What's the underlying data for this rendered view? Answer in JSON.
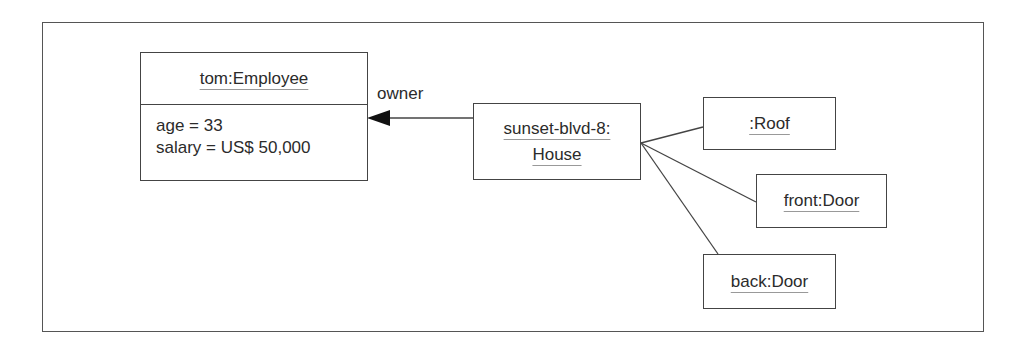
{
  "diagram": {
    "type": "UML object diagram",
    "objects": [
      {
        "id": "employee",
        "name": "tom:Employee",
        "attributes": [
          "age = 33",
          "salary = US$ 50,000"
        ]
      },
      {
        "id": "house",
        "name_lines": [
          "sunset-blvd-8:",
          "House"
        ]
      },
      {
        "id": "roof",
        "name": ":Roof"
      },
      {
        "id": "front_door",
        "name": "front:Door"
      },
      {
        "id": "back_door",
        "name": "back:Door"
      }
    ],
    "links": [
      {
        "from": "house",
        "to": "employee",
        "label": "owner",
        "navigable_arrow": true
      },
      {
        "from": "house",
        "to": "roof"
      },
      {
        "from": "house",
        "to": "front_door"
      },
      {
        "from": "house",
        "to": "back_door"
      }
    ],
    "colors": {
      "line": "#444444",
      "text": "#2b2b2b",
      "underline": "#999999"
    }
  },
  "labels": {
    "owner": "owner",
    "employee_name": "tom:Employee",
    "employee_attr_0": "age = 33",
    "employee_attr_1": "salary = US$ 50,000",
    "house_line_0": "sunset-blvd-8:",
    "house_line_1": "House",
    "roof_name": ":Roof",
    "front_door_name": "front:Door",
    "back_door_name": "back:Door"
  }
}
